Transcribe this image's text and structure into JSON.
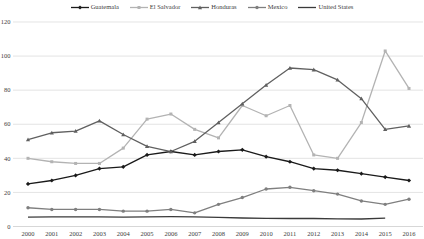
{
  "chart_data": {
    "type": "line",
    "title": "",
    "xlabel": "",
    "ylabel": "",
    "ylim": [
      0,
      120
    ],
    "yticks": [
      0,
      20,
      40,
      60,
      80,
      100,
      120
    ],
    "grid": "horizontal",
    "legend_position": "top",
    "categories": [
      "2000",
      "2001",
      "2002",
      "2003",
      "2004",
      "2005",
      "2006",
      "2007",
      "2008",
      "2009",
      "2010",
      "2011",
      "2012",
      "2013",
      "2014",
      "2015",
      "2016"
    ],
    "series": [
      {
        "name": "Guatemala",
        "color": "#1a1a1a",
        "marker": "diamond",
        "values": [
          25,
          27,
          30,
          34,
          35,
          42,
          44,
          42,
          44,
          45,
          41,
          38,
          34,
          33,
          31,
          29,
          27
        ]
      },
      {
        "name": "El Salvador",
        "color": "#b3b3b3",
        "marker": "square",
        "values": [
          40,
          38,
          37,
          37,
          46,
          63,
          66,
          57,
          52,
          71,
          65,
          71,
          42,
          40,
          61,
          103,
          81
        ]
      },
      {
        "name": "Honduras",
        "color": "#606060",
        "marker": "triangle",
        "values": [
          51,
          55,
          56,
          62,
          54,
          47,
          44,
          50,
          61,
          72,
          83,
          93,
          92,
          86,
          75,
          57,
          59
        ]
      },
      {
        "name": "Mexico",
        "color": "#7f7f7f",
        "marker": "circle",
        "values": [
          11,
          10,
          10,
          10,
          9,
          9,
          10,
          8,
          13,
          17,
          22,
          23,
          21,
          19,
          15,
          13,
          16
        ]
      },
      {
        "name": "United States",
        "color": "#3a3a3a",
        "marker": "none",
        "values": [
          5.5,
          5.6,
          5.6,
          5.7,
          5.5,
          5.6,
          5.8,
          5.7,
          5.4,
          5.0,
          4.8,
          4.7,
          4.7,
          4.5,
          4.4,
          4.9,
          null
        ]
      }
    ]
  }
}
